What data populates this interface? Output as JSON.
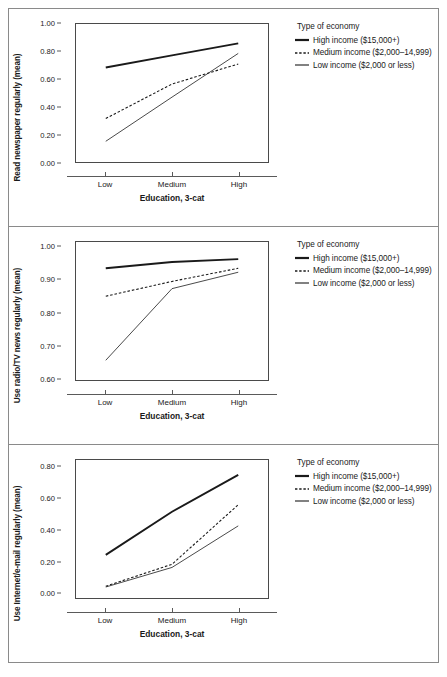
{
  "figure": {
    "legend_title": "Type of economy",
    "xlabel": "Education, 3-cat",
    "xtick_labels": [
      "Low",
      "Medium",
      "High"
    ],
    "series_names": [
      "High income ($15,000+)",
      "Medium income ($2,000–14,999)",
      "Low income ($2,000 or less)"
    ],
    "line_color": "#1a1a1a"
  },
  "chart_data": [
    {
      "type": "line",
      "title": "",
      "xlabel": "Education, 3-cat",
      "ylabel": "Read newspaper regularly (mean)",
      "categories": [
        "Low",
        "Medium",
        "High"
      ],
      "ylim": [
        0.0,
        1.0
      ],
      "yticks": [
        0.0,
        0.2,
        0.4,
        0.6,
        0.8,
        1.0
      ],
      "ytick_labels": [
        "0.00",
        "0.20",
        "0.40",
        "0.60",
        "0.80",
        "1.00"
      ],
      "grid": false,
      "legend_position": "right",
      "series": [
        {
          "name": "High income ($15,000+)",
          "style": "thick-solid",
          "values": [
            0.685,
            0.773,
            0.86
          ]
        },
        {
          "name": "Medium income ($2,000–14,999)",
          "style": "dashed",
          "values": [
            0.315,
            0.565,
            0.71
          ]
        },
        {
          "name": "Low income ($2,000 or less)",
          "style": "thin-solid",
          "values": [
            0.15,
            0.47,
            0.787
          ]
        }
      ]
    },
    {
      "type": "line",
      "title": "",
      "xlabel": "Education, 3-cat",
      "ylabel": "Use radio/TV news regularly (mean)",
      "categories": [
        "Low",
        "Medium",
        "High"
      ],
      "ylim": [
        0.595,
        1.015
      ],
      "yticks": [
        0.6,
        0.7,
        0.8,
        0.9,
        1.0
      ],
      "ytick_labels": [
        "0.60",
        "0.70",
        "0.80",
        "0.90",
        "1.00"
      ],
      "grid": false,
      "legend_position": "right",
      "series": [
        {
          "name": "High income ($15,000+)",
          "style": "thick-solid",
          "values": [
            0.935,
            0.954,
            0.963
          ]
        },
        {
          "name": "Medium income ($2,000–14,999)",
          "style": "dashed",
          "values": [
            0.85,
            0.895,
            0.935
          ]
        },
        {
          "name": "Low income ($2,000 or less)",
          "style": "thin-solid",
          "values": [
            0.655,
            0.873,
            0.923
          ]
        }
      ]
    },
    {
      "type": "line",
      "title": "",
      "xlabel": "Education, 3-cat",
      "ylabel": "Use Internet/e-mail regularly (mean)",
      "categories": [
        "Low",
        "Medium",
        "High"
      ],
      "ylim": [
        -0.035,
        0.845
      ],
      "yticks": [
        0.0,
        0.2,
        0.4,
        0.6,
        0.8
      ],
      "ytick_labels": [
        "0.00",
        "0.20",
        "0.40",
        "0.60",
        "0.80"
      ],
      "grid": false,
      "legend_position": "right",
      "series": [
        {
          "name": "High income ($15,000+)",
          "style": "thick-solid",
          "values": [
            0.24,
            0.515,
            0.75
          ]
        },
        {
          "name": "Medium income ($2,000–14,999)",
          "style": "dashed",
          "values": [
            0.04,
            0.18,
            0.56
          ]
        },
        {
          "name": "Low income ($2,000 or less)",
          "style": "thin-solid",
          "values": [
            0.035,
            0.16,
            0.425
          ]
        }
      ]
    }
  ]
}
